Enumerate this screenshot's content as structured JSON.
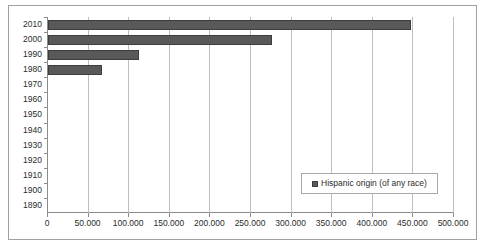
{
  "chart_data": {
    "type": "bar",
    "orientation": "horizontal",
    "title": "",
    "xlabel": "",
    "ylabel": "",
    "xlim": [
      0,
      500000
    ],
    "ylim_categories": [
      "2010",
      "2000",
      "1990",
      "1980",
      "1970",
      "1960",
      "1950",
      "1940",
      "1930",
      "1920",
      "1910",
      "1900",
      "1890"
    ],
    "categories": [
      "2010",
      "2000",
      "1990",
      "1980",
      "1970",
      "1960",
      "1950",
      "1940",
      "1930",
      "1920",
      "1910",
      "1900",
      "1890"
    ],
    "values": [
      447000,
      276000,
      112000,
      66500,
      0,
      0,
      0,
      0,
      0,
      0,
      0,
      0,
      0
    ],
    "xticks": [
      0,
      50000,
      100000,
      150000,
      200000,
      250000,
      300000,
      350000,
      400000,
      450000,
      500000
    ],
    "xtick_labels": [
      "0",
      "50.000",
      "100.000",
      "150.000",
      "200.000",
      "250.000",
      "300.000",
      "350.000",
      "400.000",
      "450.000",
      "500.000"
    ],
    "grid": true,
    "grid_axis": "x",
    "legend": {
      "position": "inside-bottom-right",
      "entries": [
        {
          "label": "Hispanic origin (of any race)",
          "color": "#595959"
        }
      ]
    },
    "series": [
      {
        "name": "Hispanic origin (of any race)",
        "color": "#595959",
        "values": [
          447000,
          276000,
          112000,
          66500,
          0,
          0,
          0,
          0,
          0,
          0,
          0,
          0,
          0
        ]
      }
    ]
  },
  "colors": {
    "bar_fill": "#595959",
    "bar_border": "#3d3d3d",
    "gridline": "#bfbfbf",
    "axis": "#8c8c8c",
    "frame_border": "#a0a0a0",
    "text": "#2b2b2b",
    "background": "#ffffff"
  }
}
